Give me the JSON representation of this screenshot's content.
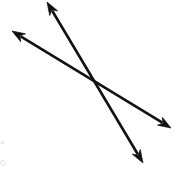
{
  "figure": {
    "background_color": "#ffffff",
    "stroke_color": "#111111",
    "stroke_width": 2.6,
    "canvas": {
      "width": 180,
      "height": 183
    },
    "intersection": {
      "label": "intersection point",
      "x": 95,
      "y": 85
    },
    "lines": [
      {
        "id": "line-1",
        "name": "steep-line",
        "description": "double-headed arrow from upper-left to lower-right, steep slope",
        "arrowheads": "both",
        "x1": 47,
        "y1": 2,
        "x2": 143,
        "y2": 163,
        "slope": 1.68
      },
      {
        "id": "line-2",
        "name": "shallow-line",
        "description": "double-headed arrow from upper-left to lower-right, shallow slope",
        "arrowheads": "both",
        "x1": 12,
        "y1": 31,
        "x2": 171,
        "y2": 128,
        "slope": 0.61
      }
    ],
    "arrowhead": {
      "length": 13,
      "half_width": 4.6
    }
  },
  "chart_data": {
    "type": "scatter",
    "xlabel": "",
    "ylabel": "",
    "xlim": [
      0,
      180
    ],
    "ylim": [
      0,
      183
    ],
    "grid": false,
    "legend": "none",
    "annotations": [
      {
        "text": "",
        "x": 95,
        "y": 85,
        "note": "lines cross here"
      }
    ],
    "series": [
      {
        "name": "steep-line",
        "x": [
          47,
          143
        ],
        "y": [
          2,
          163
        ],
        "marker": "double-arrow"
      },
      {
        "name": "shallow-line",
        "x": [
          12,
          171
        ],
        "y": [
          31,
          128
        ],
        "marker": "double-arrow"
      }
    ]
  }
}
